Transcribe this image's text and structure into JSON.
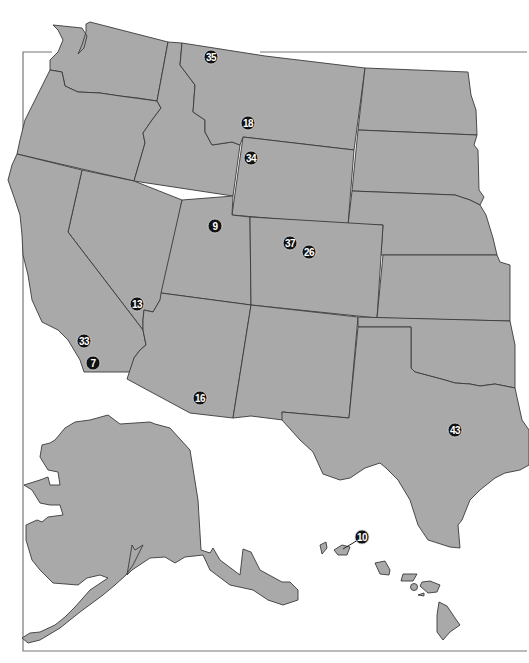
{
  "map": {
    "title": "",
    "colors": {
      "land": "#a9a9a9",
      "border": "#3a3a3a",
      "marker": "#111111",
      "marker_text": "#ffffff",
      "background": "#ffffff"
    },
    "markers": [
      {
        "id": "35",
        "label": "35",
        "x": 211,
        "y": 57
      },
      {
        "id": "18",
        "label": "18",
        "x": 248,
        "y": 123
      },
      {
        "id": "34",
        "label": "34",
        "x": 251,
        "y": 158
      },
      {
        "id": "9",
        "label": "9",
        "x": 215,
        "y": 226
      },
      {
        "id": "37",
        "label": "37",
        "x": 290,
        "y": 243
      },
      {
        "id": "26",
        "label": "26",
        "x": 309,
        "y": 252
      },
      {
        "id": "13",
        "label": "13",
        "x": 137,
        "y": 304
      },
      {
        "id": "33",
        "label": "33",
        "x": 84,
        "y": 341
      },
      {
        "id": "7",
        "label": "7",
        "x": 93,
        "y": 363
      },
      {
        "id": "16",
        "label": "16",
        "x": 200,
        "y": 398
      },
      {
        "id": "43",
        "label": "43",
        "x": 455,
        "y": 430
      },
      {
        "id": "10",
        "label": "10",
        "x": 362,
        "y": 537
      }
    ]
  }
}
